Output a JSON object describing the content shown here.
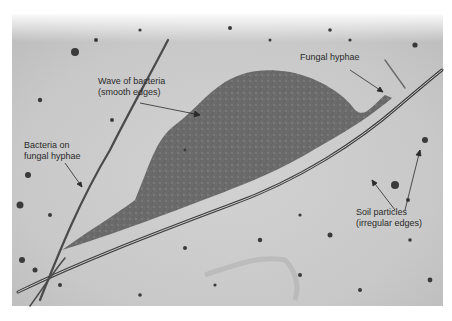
{
  "figure": {
    "colors": {
      "background_light": "#d9d9d9",
      "background_mid": "#c4c4c4",
      "bacteria_mass": "#6e6e6e",
      "hyphae": "#4a4a4a",
      "particles": "#3a3a3a",
      "label_text": "#2a2a2a"
    }
  },
  "labels": {
    "wave_of_bacteria": {
      "line1": "Wave of bacteria",
      "line2": "(smooth edges)"
    },
    "bacteria_on_hyphae": {
      "line1": "Bacteria on",
      "line2": "fungal hyphae"
    },
    "fungal_hyphae": {
      "line1": "Fungal hyphae"
    },
    "soil_particles": {
      "line1": "Soil particles",
      "line2": "(irregular edges)"
    }
  }
}
